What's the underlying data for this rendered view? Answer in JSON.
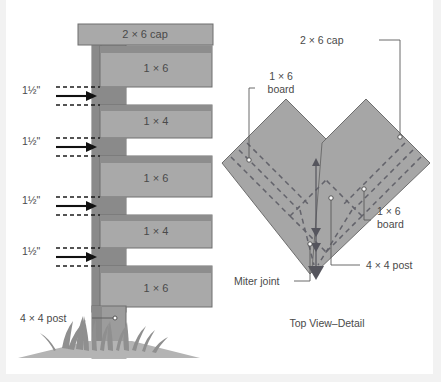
{
  "figure": {
    "title_caption": "Top View–Detail",
    "background_color": "#ffffff",
    "board_fill_color": "#a9a9a9",
    "post_fill_color": "#9c9c9c",
    "line_color": "#6e6e6e",
    "text_color": "#4a4a4a"
  },
  "elevation": {
    "cap_label": "2 × 6 cap",
    "post_label": "4 × 4 post",
    "boards": [
      {
        "label": "1 × 6",
        "nominal": "1x6"
      },
      {
        "label": "1 × 4",
        "nominal": "1x4"
      },
      {
        "label": "1 × 6",
        "nominal": "1x6"
      },
      {
        "label": "1 × 4",
        "nominal": "1x4"
      },
      {
        "label": "1 × 6",
        "nominal": "1x6"
      }
    ],
    "gap_dimensions": [
      {
        "label": "1½\""
      },
      {
        "label": "1½\""
      },
      {
        "label": "1½\""
      },
      {
        "label": "1½\""
      }
    ]
  },
  "top_view": {
    "caption": "Top View–Detail",
    "callouts": [
      {
        "id": "cap",
        "label": "2 × 6 cap"
      },
      {
        "id": "board-left",
        "label_line1": "1 × 6",
        "label_line2": "board"
      },
      {
        "id": "board-right",
        "label_line1": "1 × 6",
        "label_line2": "board"
      },
      {
        "id": "post",
        "label": "4 × 4 post"
      },
      {
        "id": "miter",
        "label": "Miter joint"
      }
    ]
  }
}
